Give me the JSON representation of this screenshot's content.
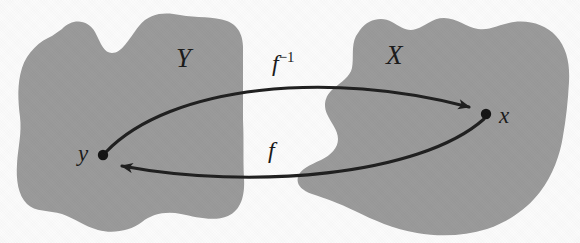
{
  "figure": {
    "type": "set-mapping-diagram",
    "colors": {
      "background": "#fbfbfb",
      "set_fill": "#9a9a9a",
      "ink": "#1a1a1a"
    },
    "sets": [
      {
        "id": "set-y",
        "label": "Y",
        "label_x": 184,
        "label_y": 60
      },
      {
        "id": "set-x",
        "label": "X",
        "label_x": 393,
        "label_y": 57
      }
    ],
    "points": [
      {
        "id": "point-y",
        "label": "y",
        "dot_x": 103,
        "dot_y": 155,
        "label_x": 80,
        "label_y": 153
      },
      {
        "id": "point-x",
        "label": "x",
        "dot_x": 486,
        "dot_y": 114,
        "label_x": 501,
        "label_y": 116
      }
    ],
    "arrows": [
      {
        "id": "arrow-inverse",
        "label": "f",
        "superscript": "−1",
        "label_x": 272,
        "label_y": 52,
        "from": "y",
        "to": "x",
        "direction": "left-to-right",
        "position": "upper"
      },
      {
        "id": "arrow-forward",
        "label": "f",
        "superscript": "",
        "label_x": 268,
        "label_y": 140,
        "from": "x",
        "to": "y",
        "direction": "right-to-left",
        "position": "lower"
      }
    ]
  }
}
